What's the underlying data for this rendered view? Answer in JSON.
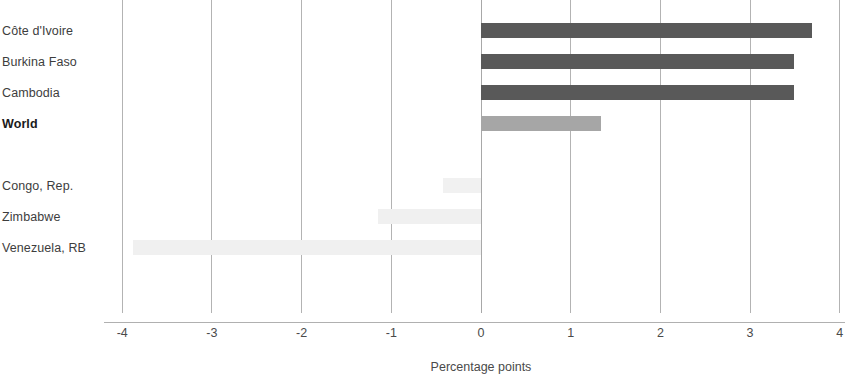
{
  "chart_data": {
    "type": "bar",
    "orientation": "horizontal",
    "title": "",
    "subtitle": "",
    "xlabel": "Percentage points",
    "ylabel": "",
    "xlim": [
      -4,
      4
    ],
    "xticks": [
      -4,
      -3,
      -2,
      -1,
      0,
      1,
      2,
      3,
      4
    ],
    "xtick_labels": [
      "-4",
      "-3",
      "-2",
      "-1",
      "0",
      "1",
      "2",
      "3",
      "4"
    ],
    "grid": "vertical",
    "legend": "none",
    "zero_reference_line": 0,
    "categories": [
      "Côte d'Ivoire",
      "Burkina Faso",
      "Cambodia",
      "World",
      "",
      "Congo, Rep.",
      "Zimbabwe",
      "Venezuela, RB"
    ],
    "values": [
      3.69,
      3.49,
      3.49,
      1.34,
      null,
      -0.42,
      -1.15,
      -3.88
    ],
    "bars": [
      {
        "category": "Côte d'Ivoire",
        "value": 3.69,
        "color": "#595959",
        "highlight": false
      },
      {
        "category": "Burkina Faso",
        "value": 3.49,
        "color": "#595959",
        "highlight": false
      },
      {
        "category": "Cambodia",
        "value": 3.49,
        "color": "#595959",
        "highlight": false
      },
      {
        "category": "World",
        "value": 1.34,
        "color": "#a6a6a6",
        "highlight": true
      },
      {
        "category": "",
        "value": null,
        "color": "transparent",
        "highlight": false
      },
      {
        "category": "Congo, Rep.",
        "value": -0.42,
        "color": "#f1f1f1",
        "highlight": false
      },
      {
        "category": "Zimbabwe",
        "value": -1.15,
        "color": "#f0f0f0",
        "highlight": false
      },
      {
        "category": "Venezuela, RB",
        "value": -3.88,
        "color": "#f0f0f0",
        "highlight": false
      }
    ]
  },
  "colors": {
    "bar_positive": "#595959",
    "bar_world": "#a6a6a6",
    "bar_negative": "#f0f0f0",
    "gridline": "#b3b3b3",
    "axis_line": "#b0b0b0",
    "label_text": "#3d3d3d",
    "tick_text": "#4a4a4a",
    "background": "#ffffff"
  }
}
